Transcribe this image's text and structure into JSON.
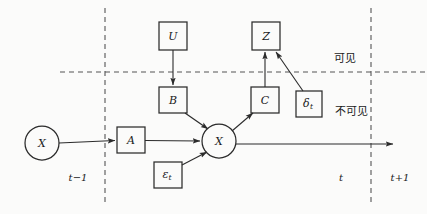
{
  "diagram": {
    "colors": {
      "background": "#fbfbfa",
      "stroke": "#2b2b2b",
      "dashed": "#555555",
      "text": "#1a1a1a"
    },
    "nodes": [
      {
        "id": "x-prev",
        "label": "X",
        "sub": "",
        "shape": "circle",
        "cx": 42,
        "cy": 143,
        "r": 17
      },
      {
        "id": "a-box",
        "label": "A",
        "sub": "",
        "shape": "box",
        "cx": 131,
        "cy": 140,
        "w": 28,
        "h": 26
      },
      {
        "id": "b-box",
        "label": "B",
        "sub": "",
        "shape": "box",
        "cx": 173,
        "cy": 100,
        "w": 28,
        "h": 26
      },
      {
        "id": "u-box",
        "label": "U",
        "sub": "",
        "shape": "box",
        "cx": 173,
        "cy": 36,
        "w": 28,
        "h": 28
      },
      {
        "id": "eps-box",
        "label": "ε",
        "sub": "t",
        "shape": "box",
        "cx": 168,
        "cy": 175,
        "w": 28,
        "h": 26
      },
      {
        "id": "x-curr",
        "label": "X",
        "sub": "",
        "shape": "circle",
        "cx": 219,
        "cy": 141,
        "r": 17
      },
      {
        "id": "c-box",
        "label": "C",
        "sub": "",
        "shape": "box",
        "cx": 265,
        "cy": 100,
        "w": 28,
        "h": 26
      },
      {
        "id": "z-box",
        "label": "Z",
        "sub": "",
        "shape": "box",
        "cx": 266,
        "cy": 36,
        "w": 28,
        "h": 28
      },
      {
        "id": "delta-box",
        "label": "δ",
        "sub": "t",
        "shape": "box",
        "cx": 309,
        "cy": 104,
        "w": 26,
        "h": 26
      }
    ],
    "edges": [
      {
        "id": "x-prev-to-a",
        "from": "x-prev",
        "to": "a-box",
        "arrow": true
      },
      {
        "id": "a-to-x-curr",
        "from": "a-box",
        "to": "x-curr",
        "arrow": true
      },
      {
        "id": "u-to-b",
        "from": "u-box",
        "to": "b-box",
        "arrow": true
      },
      {
        "id": "b-to-x-curr",
        "from": "b-box",
        "to": "x-curr",
        "arrow": true
      },
      {
        "id": "eps-to-x-curr",
        "from": "eps-box",
        "to": "x-curr",
        "arrow": true
      },
      {
        "id": "x-curr-to-c",
        "from": "x-curr",
        "to": "c-box",
        "arrow": true
      },
      {
        "id": "c-to-z",
        "from": "c-box",
        "to": "z-box",
        "arrow": true
      },
      {
        "id": "delta-to-z",
        "from": "delta-box",
        "to": "z-box",
        "arrow": true
      },
      {
        "id": "x-curr-to-next",
        "from": "x-curr",
        "to": "t-plus-1-axis",
        "arrow": true
      }
    ],
    "dashed_lines": [
      {
        "id": "time-divider-t-minus-1",
        "orientation": "vertical",
        "x": 105,
        "y1": 8,
        "y2": 206
      },
      {
        "id": "time-divider-t-plus-1",
        "orientation": "vertical",
        "x": 371,
        "y1": 8,
        "y2": 206
      },
      {
        "id": "visibility-divider",
        "orientation": "horizontal",
        "y": 72,
        "x1": 60,
        "x2": 427
      }
    ],
    "region_labels": [
      {
        "id": "visible-label",
        "text": "可见",
        "x": 345,
        "y": 57
      },
      {
        "id": "invisible-label",
        "text": "不可见",
        "x": 351,
        "y": 110
      }
    ],
    "time_labels": [
      {
        "id": "t-minus-1-label",
        "text": "t−1",
        "x": 78,
        "y": 177
      },
      {
        "id": "t-label",
        "text": "t",
        "x": 341,
        "y": 177
      },
      {
        "id": "t-plus-1-label",
        "text": "t+1",
        "x": 400,
        "y": 177
      }
    ]
  }
}
